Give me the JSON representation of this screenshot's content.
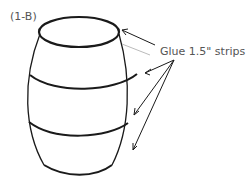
{
  "figure": {
    "step_label": "(1-B)",
    "callout": "Glue 1.5\" strips",
    "colors": {
      "ink": "#1a1a1a",
      "label": "#555555",
      "guide": "#bbbbbb"
    }
  }
}
